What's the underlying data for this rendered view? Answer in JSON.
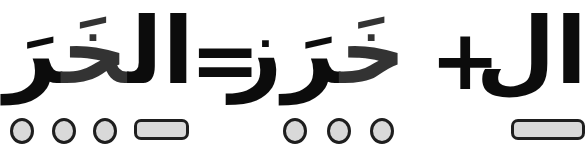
{
  "equation": {
    "left_word": {
      "prefix": "ال",
      "highlight": "خَ",
      "rest": "رَز"
    },
    "equals": "=",
    "middle_word": {
      "highlight": "خَ",
      "rest": "رَز"
    },
    "plus": "+",
    "right_word": "ال"
  },
  "markers": {
    "left_group": [
      "syllable-dot",
      "syllable-dot",
      "syllable-dot",
      "article-bar"
    ],
    "middle_group": [
      "syllable-dot",
      "syllable-dot",
      "syllable-dot"
    ],
    "right_group": [
      "article-bar"
    ]
  },
  "colors": {
    "text": "#0c0c0c",
    "highlight_letter": "#333333",
    "diacritic": "#aaaaaa",
    "marker_fill": "#d9d9d9",
    "marker_stroke": "#1e1e1e"
  }
}
